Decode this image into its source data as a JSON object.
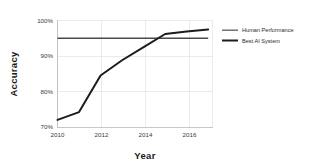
{
  "chart_data": {
    "type": "line",
    "title": "",
    "xlabel": "Year",
    "ylabel": "Accuracy",
    "xlim": [
      2010,
      2017.2
    ],
    "ylim": [
      70,
      100
    ],
    "grid": true,
    "legend_position": "right",
    "x_tick_labels": [
      "2010",
      "2012",
      "2014",
      "2016"
    ],
    "x_tick_values": [
      2010,
      2012,
      2014,
      2016
    ],
    "y_tick_labels": [
      "70%",
      "80%",
      "90%",
      "100%"
    ],
    "y_tick_values": [
      70,
      80,
      90,
      100
    ],
    "series": [
      {
        "name": "Best AI System",
        "color": "#1c1c1c",
        "x": [
          2010,
          2011,
          2012,
          2013,
          2014,
          2015,
          2016,
          2017
        ],
        "values": [
          72.0,
          74.2,
          84.5,
          88.8,
          92.5,
          96.2,
          96.9,
          97.5
        ]
      },
      {
        "name": "Human Performance",
        "color": "#4a4a4a",
        "x": [
          2010,
          2017
        ],
        "values": [
          95.0,
          95.0
        ]
      }
    ],
    "legend_entries": [
      "Human Performance",
      "Best AI System"
    ]
  },
  "legend": {
    "items": [
      {
        "label": "Human Performance"
      },
      {
        "label": "Best AI System"
      }
    ]
  },
  "axes": {
    "x_title": "Year",
    "y_title": "Accuracy"
  }
}
